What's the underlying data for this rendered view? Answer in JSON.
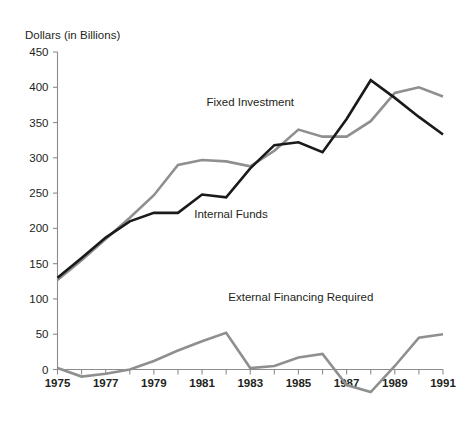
{
  "chart_data": {
    "type": "line",
    "title": "",
    "ylabel": "Dollars (in Billions)",
    "xlabel": "",
    "ylim": [
      0,
      450
    ],
    "xlim": [
      1975,
      1991
    ],
    "yticks": [
      0,
      50,
      100,
      150,
      200,
      250,
      300,
      350,
      400,
      450
    ],
    "ytick_labels": [
      "0",
      "50",
      "100",
      "150",
      "200",
      "250",
      "300",
      "350",
      "400",
      "450"
    ],
    "xticks": [
      1975,
      1976,
      1977,
      1978,
      1979,
      1980,
      1981,
      1982,
      1983,
      1984,
      1985,
      1986,
      1987,
      1988,
      1989,
      1990,
      1991
    ],
    "xtick_labels": [
      "1975",
      "",
      "1977",
      "",
      "1979",
      "",
      "1981",
      "",
      "1983",
      "",
      "1985",
      "",
      "1987",
      "",
      "1989",
      "",
      "1991"
    ],
    "xtick_labels_shown": [
      "1975",
      "1977",
      "1979",
      "1981",
      "1983",
      "1985",
      "1987",
      "1989",
      "1991"
    ],
    "grid": false,
    "legend_position": "inline-annotations",
    "x": [
      1975,
      1976,
      1977,
      1978,
      1979,
      1980,
      1981,
      1982,
      1983,
      1984,
      1985,
      1986,
      1987,
      1988,
      1989,
      1990,
      1991
    ],
    "series": [
      {
        "name": "Fixed Investment",
        "color": "#1a1a1a",
        "linewidth": 2.6,
        "values": [
          130,
          158,
          187,
          210,
          222,
          222,
          248,
          244,
          285,
          318,
          322,
          308,
          355,
          410,
          385,
          358,
          333
        ]
      },
      {
        "name": "Internal Funds",
        "color": "#8f8f8f",
        "linewidth": 2.6,
        "values": [
          127,
          155,
          185,
          215,
          247,
          290,
          297,
          295,
          288,
          310,
          340,
          330,
          330,
          352,
          392,
          400,
          387
        ]
      },
      {
        "name": "External Financing Required",
        "color": "#8f8f8f",
        "linewidth": 2.6,
        "values": [
          2,
          -10,
          -6,
          0,
          12,
          27,
          40,
          52,
          2,
          5,
          17,
          22,
          -22,
          -32,
          5,
          45,
          50
        ]
      }
    ],
    "annotations": [
      {
        "text": "Fixed Investment",
        "x": 1983.0,
        "y": 374,
        "anchor": "middle"
      },
      {
        "text": "Internal Funds",
        "x": 1982.2,
        "y": 215,
        "anchor": "middle"
      },
      {
        "text": "External Financing Required",
        "x": 1985.1,
        "y": 97,
        "anchor": "middle"
      }
    ]
  },
  "labels": {
    "y_axis_title": "Dollars (in Billions)",
    "series_fixed_investment": "Fixed Investment",
    "series_internal_funds": "Internal Funds",
    "series_external_financing": "External Financing Required"
  },
  "colors": {
    "fixed_investment": "#1a1a1a",
    "internal_funds": "#8f8f8f",
    "external_financing": "#8f8f8f",
    "axis": "#8c8c8c",
    "text": "#231f20",
    "background": "#ffffff"
  }
}
